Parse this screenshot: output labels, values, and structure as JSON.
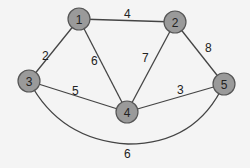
{
  "graph": {
    "type": "weighted-undirected-graph",
    "nodes": [
      {
        "id": "1",
        "label": "1",
        "x": 79,
        "y": 19
      },
      {
        "id": "2",
        "label": "2",
        "x": 175,
        "y": 22
      },
      {
        "id": "3",
        "label": "3",
        "x": 29,
        "y": 81
      },
      {
        "id": "4",
        "label": "4",
        "x": 127,
        "y": 112
      },
      {
        "id": "5",
        "label": "5",
        "x": 224,
        "y": 84
      }
    ],
    "edges": [
      {
        "from": "1",
        "to": "2",
        "weight": "4",
        "label_x": 128,
        "label_y": 18
      },
      {
        "from": "1",
        "to": "3",
        "weight": "2",
        "label_x": 46,
        "label_y": 60
      },
      {
        "from": "1",
        "to": "4",
        "weight": "6",
        "label_x": 95,
        "label_y": 65
      },
      {
        "from": "2",
        "to": "4",
        "weight": "7",
        "label_x": 146,
        "label_y": 62
      },
      {
        "from": "2",
        "to": "5",
        "weight": "8",
        "label_x": 209,
        "label_y": 52
      },
      {
        "from": "3",
        "to": "4",
        "weight": "5",
        "label_x": 76,
        "label_y": 95
      },
      {
        "from": "4",
        "to": "5",
        "weight": "3",
        "label_x": 181,
        "label_y": 94
      },
      {
        "from": "3",
        "to": "5",
        "weight": "6",
        "label_x": 128,
        "label_y": 158,
        "curved": true
      }
    ]
  },
  "colors": {
    "node_fill": "#9a9a9a",
    "node_stroke": "#555555",
    "edge": "#444444",
    "background": "#f4f4f4"
  }
}
